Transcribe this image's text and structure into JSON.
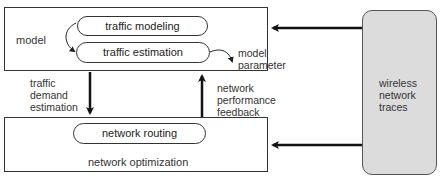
{
  "model_box": {
    "label": "model",
    "pills": [
      {
        "label": "traffic modeling"
      },
      {
        "label": "traffic estimation"
      }
    ],
    "output_label": [
      "model",
      "parameter"
    ]
  },
  "optimization_box": {
    "label": "network optimization",
    "pill": {
      "label": "network routing"
    }
  },
  "arrows": {
    "down_label": [
      "traffic",
      "demand",
      "estimation"
    ],
    "up_label": [
      "network",
      "performance",
      "feedback"
    ]
  },
  "traces_box": {
    "label": [
      "wireless",
      "network",
      "traces"
    ],
    "fill": "#dcdcdc"
  }
}
